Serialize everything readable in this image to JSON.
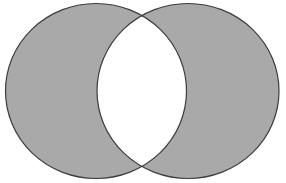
{
  "diagram": {
    "type": "venn",
    "sets": [
      {
        "name": "left-set",
        "cx": 96,
        "cy": 91,
        "rx": 90.5,
        "ry": 87.5
      },
      {
        "name": "right-set",
        "cx": 188,
        "cy": 91,
        "rx": 91,
        "ry": 87.5
      }
    ],
    "shaded_region": "symmetric-difference",
    "colors": {
      "fill": "#a9a9a9",
      "stroke": "#3c3c3c",
      "intersection": "#ffffff",
      "background": "#ffffff"
    }
  }
}
